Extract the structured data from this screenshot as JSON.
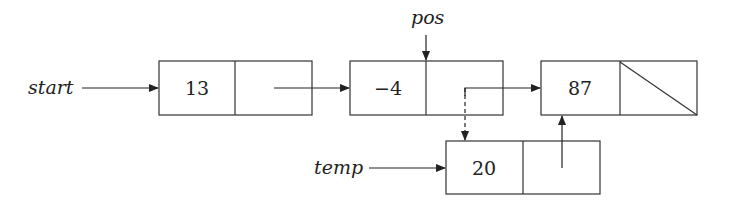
{
  "diagram": {
    "type": "linked-list-insertion",
    "pointers": [
      {
        "name": "start",
        "label": "start",
        "target": "node-13"
      },
      {
        "name": "pos",
        "label": "pos",
        "target": "node--4"
      },
      {
        "name": "temp",
        "label": "temp",
        "target": "node-20"
      }
    ],
    "nodes": [
      {
        "id": "node-13",
        "value": "13",
        "next": "node--4"
      },
      {
        "id": "node--4",
        "value": "−4",
        "next": "node-87",
        "pending_next": "node-20"
      },
      {
        "id": "node-87",
        "value": "87",
        "next": null
      },
      {
        "id": "node-20",
        "value": "20",
        "next": "node-87"
      }
    ],
    "colors": {
      "stroke": "#333333",
      "background": "#ffffff"
    }
  }
}
